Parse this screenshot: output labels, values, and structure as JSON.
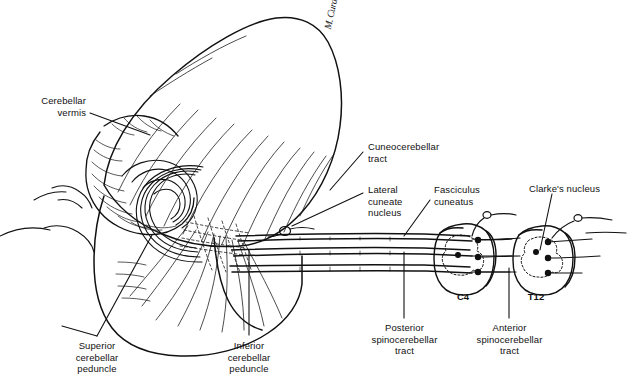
{
  "figure": {
    "ink_color": "#111111",
    "background_color": "#ffffff",
    "width": 640,
    "height": 392
  },
  "signature": {
    "text": "M. Curatolo"
  },
  "labels": [
    {
      "id": "cerebellar-vermis",
      "text": "Cerebellar\nvermis",
      "align": "right",
      "x": 8,
      "y": 95,
      "width": 78
    },
    {
      "id": "cuneocerebellar-tract",
      "text": "Cuneocerebellar\ntract",
      "align": "left",
      "x": 368,
      "y": 141,
      "width": 95
    },
    {
      "id": "lateral-cuneate-nucleus",
      "text": "Lateral\ncuneate\nnucleus",
      "align": "left",
      "x": 368,
      "y": 184,
      "width": 60
    },
    {
      "id": "fasciculus-cuneatus",
      "text": "Fasciculus\ncuneatus",
      "align": "left",
      "x": 434,
      "y": 184,
      "width": 70
    },
    {
      "id": "clarkes-nucleus",
      "text": "Clarke's nucleus",
      "align": "left",
      "x": 529,
      "y": 183,
      "width": 90
    },
    {
      "id": "superior-cerebellar-peduncle",
      "text": "Superior\ncerebellar\npeduncle",
      "align": "center",
      "x": 62,
      "y": 340,
      "width": 70
    },
    {
      "id": "inferior-cerebellar-peduncle",
      "text": "Inferior\ncerebellar\npeduncle",
      "align": "center",
      "x": 214,
      "y": 340,
      "width": 70
    },
    {
      "id": "posterior-spinocerebellar-tract",
      "text": "Posterior\nspinocerebellar\ntract",
      "align": "center",
      "x": 357,
      "y": 322,
      "width": 95
    },
    {
      "id": "anterior-spinocerebellar-tract",
      "text": "Anterior\nspinocerebellar\ntract",
      "align": "center",
      "x": 462,
      "y": 322,
      "width": 95
    }
  ],
  "segment_labels": [
    {
      "id": "c4",
      "text": "C4",
      "x": 449,
      "y": 291,
      "width": 28
    },
    {
      "id": "t12",
      "text": "T12",
      "x": 522,
      "y": 291,
      "width": 28
    }
  ]
}
